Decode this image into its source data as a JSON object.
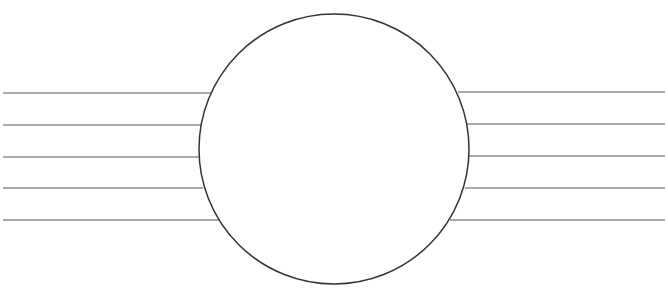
{
  "worksheet": {
    "title": "WRITING OFFER",
    "title_clipped": true,
    "circle": {
      "cx": 334,
      "cy": 149,
      "r": 135
    },
    "left_lines": [
      {
        "y": 93,
        "x1": 3,
        "x2": 212
      },
      {
        "y": 125,
        "x1": 3,
        "x2": 202
      },
      {
        "y": 157,
        "x1": 3,
        "x2": 199
      },
      {
        "y": 188,
        "x1": 3,
        "x2": 203
      },
      {
        "y": 220,
        "x1": 3,
        "x2": 219
      }
    ],
    "right_lines": [
      {
        "y": 92,
        "x1": 458,
        "x2": 665
      },
      {
        "y": 124,
        "x1": 467,
        "x2": 665
      },
      {
        "y": 156,
        "x1": 469,
        "x2": 665
      },
      {
        "y": 188,
        "x1": 465,
        "x2": 665
      },
      {
        "y": 220,
        "x1": 450,
        "x2": 665
      }
    ],
    "colors": {
      "line": "#555555",
      "circle": "#333333",
      "background": "#ffffff"
    }
  }
}
